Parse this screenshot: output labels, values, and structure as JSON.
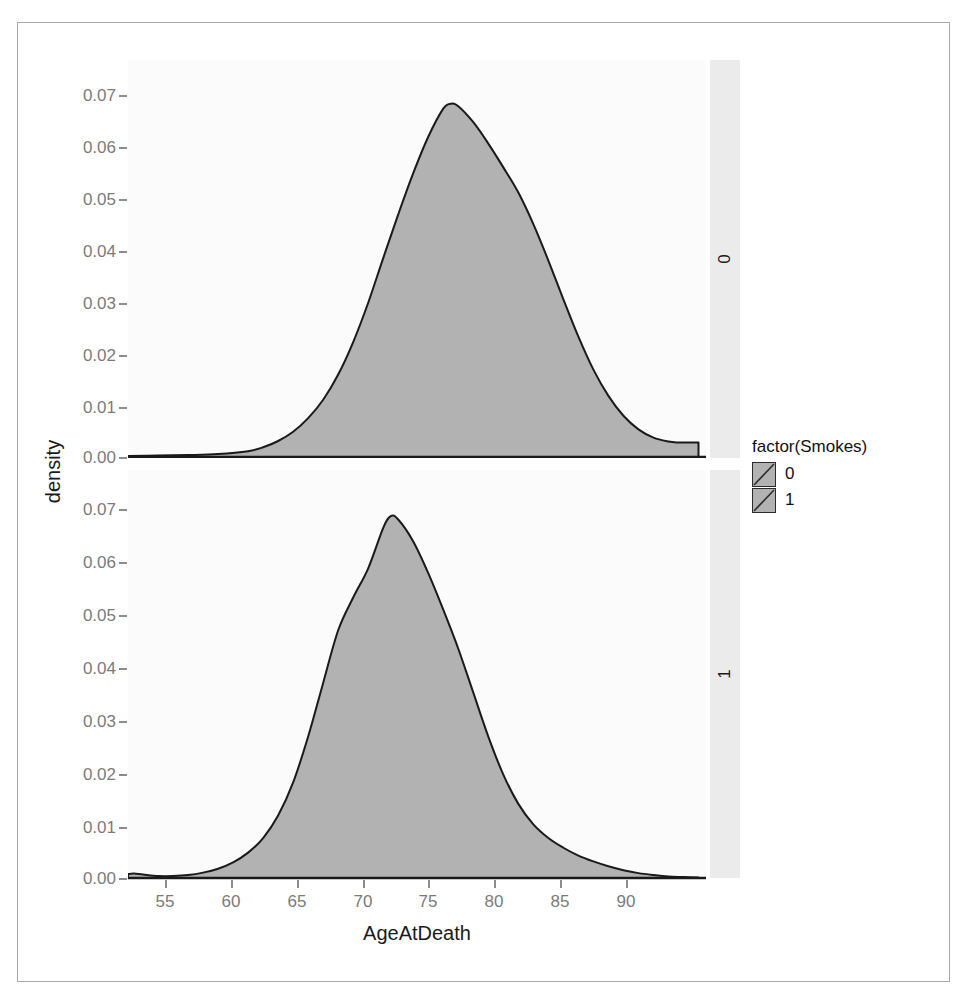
{
  "chart_data": {
    "type": "area",
    "title": "",
    "subtitle": "",
    "xlabel": "AgeAtDeath",
    "ylabel": "density",
    "xlim": [
      52,
      90.5
    ],
    "ylim": [
      0,
      0.0775
    ],
    "grid": false,
    "legend_position": "right",
    "legend_title": "factor(Smokes)",
    "facet_variable": "factor(Smokes)",
    "facet_strip_position": "right",
    "x_ticks": [
      55,
      60,
      65,
      70,
      75,
      80,
      85,
      90
    ],
    "x_tick_labels": [
      "55",
      "60",
      "65",
      "70",
      "75",
      "80",
      "85",
      "90"
    ],
    "y_ticks": [
      0.0,
      0.01,
      0.02,
      0.03,
      0.04,
      0.05,
      0.06,
      0.07
    ],
    "y_tick_labels": [
      "0.00",
      "0.01",
      "0.02",
      "0.03",
      "0.04",
      "0.05",
      "0.06",
      "0.07"
    ],
    "fill_color": "#b2b2b2",
    "line_color": "#1a1a1a",
    "panel_background": "#fbfbfb",
    "strip_background": "#ebebeb",
    "series": [
      {
        "name": "0",
        "facet_label": "0",
        "legend_label": "0",
        "peak_x": 73.5,
        "peak_y": 0.0728,
        "x": [
          52,
          54,
          56,
          58,
          60,
          61,
          62,
          63,
          64,
          65,
          66,
          67,
          68,
          69,
          70,
          71,
          72,
          73,
          73.5,
          74,
          75,
          76,
          77,
          78,
          79,
          80,
          81,
          82,
          83,
          84,
          85,
          86,
          87,
          88,
          88.6,
          89.4,
          90
        ],
        "y": [
          0.0002,
          0.0003,
          0.0004,
          0.0006,
          0.0012,
          0.002,
          0.0033,
          0.0052,
          0.008,
          0.0118,
          0.017,
          0.0237,
          0.0318,
          0.041,
          0.05,
          0.0585,
          0.066,
          0.0718,
          0.0728,
          0.0723,
          0.069,
          0.0646,
          0.0597,
          0.0545,
          0.048,
          0.0405,
          0.0325,
          0.0248,
          0.018,
          0.0126,
          0.0085,
          0.0057,
          0.004,
          0.0032,
          0.003,
          0.003,
          0.003
        ]
      },
      {
        "name": "1",
        "facet_label": "1",
        "legend_label": "1",
        "peak_x": 69.5,
        "peak_y": 0.0742,
        "x": [
          52,
          52.4,
          53,
          54,
          55,
          56,
          57,
          58,
          59,
          60,
          61,
          62,
          63,
          64,
          65,
          66,
          67,
          68,
          69,
          69.5,
          70,
          71,
          72,
          73,
          74,
          75,
          76,
          77,
          78,
          79,
          80,
          81,
          82,
          83,
          84,
          85,
          86,
          87,
          88,
          89,
          90
        ],
        "y": [
          0.0008,
          0.0009,
          0.0007,
          0.0004,
          0.0004,
          0.0006,
          0.0011,
          0.0019,
          0.0032,
          0.0052,
          0.0082,
          0.0128,
          0.0196,
          0.029,
          0.04,
          0.0508,
          0.0575,
          0.0635,
          0.0718,
          0.0742,
          0.0735,
          0.069,
          0.0625,
          0.055,
          0.047,
          0.038,
          0.029,
          0.0212,
          0.0152,
          0.011,
          0.0082,
          0.0062,
          0.0046,
          0.0034,
          0.0024,
          0.0016,
          0.001,
          0.0006,
          0.0003,
          0.0002,
          0.0001
        ]
      }
    ]
  },
  "legend": {
    "title": "factor(Smokes)",
    "items": [
      {
        "label": "0"
      },
      {
        "label": "1"
      }
    ]
  },
  "axes": {
    "x_title": "AgeAtDeath",
    "y_title": "density"
  }
}
